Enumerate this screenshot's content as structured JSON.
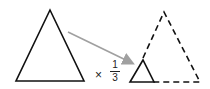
{
  "diagram": {
    "operator": "×",
    "scale_factor": {
      "numerator": "1",
      "denominator": "3"
    },
    "shapes": [
      {
        "name": "original-triangle",
        "style": "solid"
      },
      {
        "name": "scaled-triangle",
        "style": "solid"
      },
      {
        "name": "reference-outline-triangle",
        "style": "dashed"
      }
    ],
    "colors": {
      "stroke": "#111111",
      "arrow": "#a0a0a0"
    }
  }
}
